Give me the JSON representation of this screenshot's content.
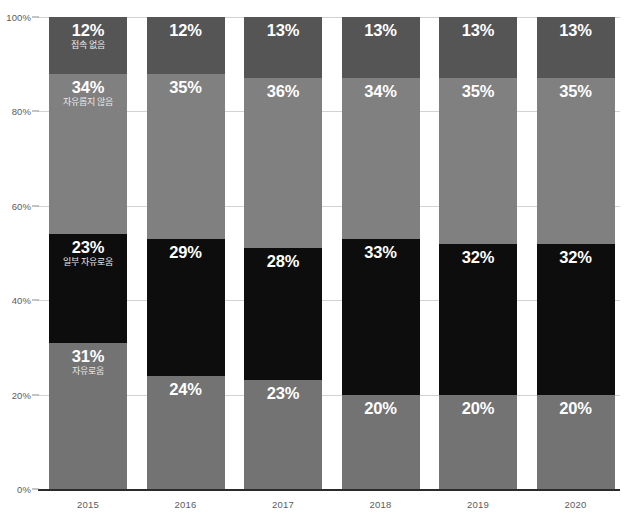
{
  "chart_data": {
    "type": "bar",
    "subtype": "stacked-100-percent",
    "title": "",
    "xlabel": "",
    "ylabel": "",
    "ylim": [
      0,
      100
    ],
    "grid": true,
    "legend_position": "in-bars-first-column",
    "categories": [
      "2015",
      "2016",
      "2017",
      "2018",
      "2019",
      "2020"
    ],
    "ytick_labels": [
      "0%",
      "20%",
      "40%",
      "60%",
      "80%",
      "100%"
    ],
    "ytick_values": [
      0,
      20,
      40,
      60,
      80,
      100
    ],
    "series": [
      {
        "name": "접속 없음",
        "color": "#555555",
        "values": [
          12,
          12,
          13,
          13,
          13,
          13
        ],
        "labels": [
          "12%",
          "12%",
          "13%",
          "13%",
          "13%",
          "13%"
        ]
      },
      {
        "name": "자유롭지 않음",
        "color": "#808080",
        "values": [
          34,
          35,
          36,
          34,
          35,
          35
        ],
        "labels": [
          "34%",
          "35%",
          "36%",
          "34%",
          "35%",
          "35%"
        ]
      },
      {
        "name": "일부 자유로움",
        "color": "#0d0d0d",
        "values": [
          23,
          29,
          28,
          33,
          32,
          32
        ],
        "labels": [
          "23%",
          "29%",
          "28%",
          "33%",
          "32%",
          "32%"
        ]
      },
      {
        "name": "자유로움",
        "color": "#737373",
        "values": [
          31,
          24,
          23,
          20,
          20,
          20
        ],
        "labels": [
          "31%",
          "24%",
          "23%",
          "20%",
          "20%",
          "20%"
        ]
      }
    ]
  },
  "style": {
    "gridline_color": "#d2d2d2",
    "axis_color": "#2b2b2b",
    "tick_text_color": "#5c5c5c",
    "value_text_color": "#ffffff",
    "name_text_color": "#e8e8e8",
    "background": "#ffffff"
  }
}
